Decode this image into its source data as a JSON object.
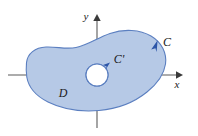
{
  "figure": {
    "kind": "math-diagram",
    "axes": {
      "x_label": "x",
      "y_label": "y",
      "x_axis_y": 75,
      "y_axis_x": 97,
      "x_axis_start": 8,
      "x_axis_end": 181,
      "y_axis_top": 16,
      "y_axis_bottom": 128
    },
    "labels": {
      "outer_curve": "C",
      "inner_curve": "C'",
      "region": "D"
    },
    "colors": {
      "region_fill": "#b6c9e6",
      "region_stroke": "#5b7fc0",
      "hole_fill": "#ffffff",
      "arrow_color": "#2d56a8",
      "axis_color": "#5a5a5a",
      "label_color": "#1a1a1a",
      "background": "#ffffff"
    },
    "hole": {
      "center_x": 97,
      "center_y": 75,
      "radius": 11
    },
    "orientation": {
      "outer": "counterclockwise",
      "inner": "counterclockwise"
    }
  }
}
